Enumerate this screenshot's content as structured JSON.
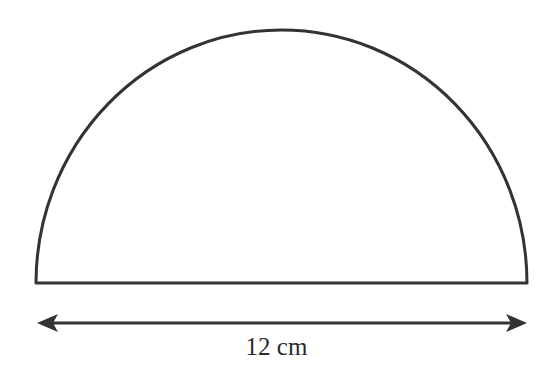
{
  "diagram": {
    "shape": "semicircle",
    "dimension_label": "12 cm",
    "stroke_color": "#333333",
    "background_color": "#ffffff"
  }
}
